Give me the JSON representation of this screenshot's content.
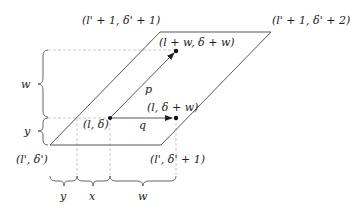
{
  "diagram": {
    "corners": {
      "top_left": "(l' + 1, δ' + 1)",
      "top_right": "(l' + 1, δ' + 2)",
      "bottom_left": "(l', δ')",
      "bottom_right": "(l', δ' + 1)"
    },
    "points": {
      "origin": "(l, δ)",
      "p_end": "(l + w, δ + w)",
      "q_end": "(l, δ + w)"
    },
    "vectors": {
      "p": "p",
      "q": "q"
    },
    "braces_left": {
      "upper": "w",
      "lower": "y"
    },
    "braces_bottom": {
      "first": "y",
      "second": "x",
      "third": "w"
    },
    "colors": {
      "line": "#444444",
      "dashed": "#bbbbbb",
      "text": "#222222"
    }
  }
}
